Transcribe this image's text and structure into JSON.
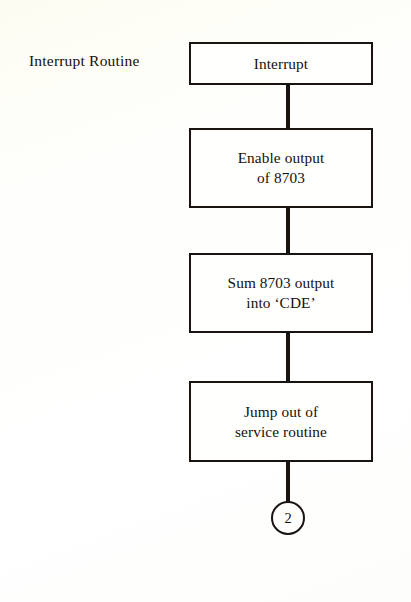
{
  "diagram": {
    "title": "Interrupt Routine",
    "side_label": "Interrupt Routine",
    "nodes": [
      {
        "id": "interrupt",
        "shape": "rectangle",
        "text": "Interrupt"
      },
      {
        "id": "enable-output",
        "shape": "rectangle",
        "text": "Enable output\nof 8703"
      },
      {
        "id": "sum-output",
        "shape": "rectangle",
        "text": "Sum 8703 output\ninto ‘CDE’"
      },
      {
        "id": "jump-out",
        "shape": "rectangle",
        "text": "Jump out of\nservice routine"
      }
    ],
    "terminal": {
      "id": "off-page-connector",
      "shape": "circle",
      "text": "2"
    },
    "connectors": [
      {
        "from": "interrupt",
        "to": "enable-output",
        "style": "line"
      },
      {
        "from": "enable-output",
        "to": "sum-output",
        "style": "line"
      },
      {
        "from": "sum-output",
        "to": "jump-out",
        "style": "line"
      },
      {
        "from": "jump-out",
        "to": "off-page-connector",
        "style": "line"
      }
    ],
    "colors": {
      "stroke": "#1a1410",
      "text": "#14110d",
      "node_fill": "#fffffe",
      "page_background": "#fefefb"
    }
  }
}
